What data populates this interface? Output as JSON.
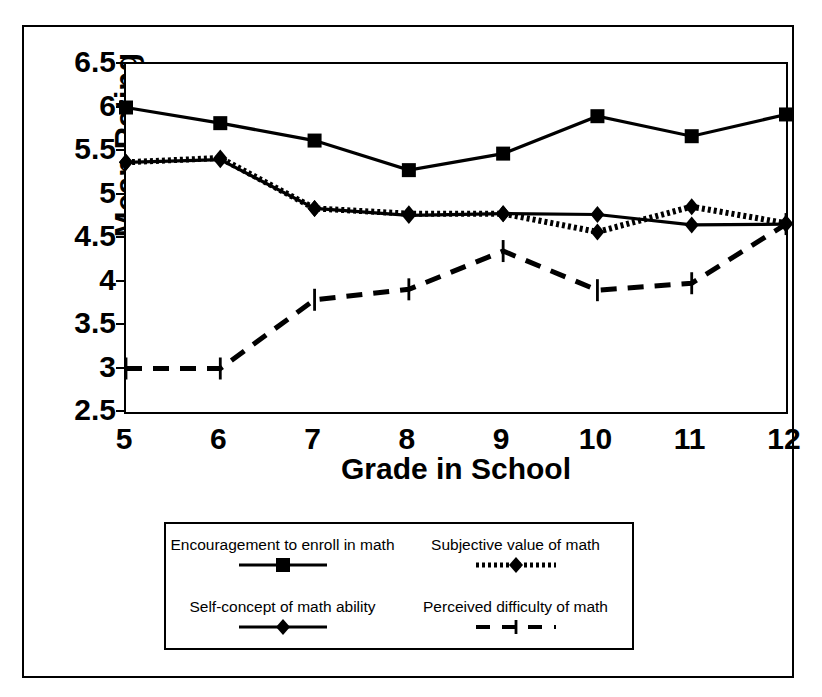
{
  "chart_data": {
    "type": "line",
    "title": "",
    "xlabel": "Grade in School",
    "ylabel": "Mean Rating",
    "categories": [
      5,
      6,
      7,
      8,
      9,
      10,
      11,
      12
    ],
    "x": [
      5,
      6,
      7,
      8,
      9,
      10,
      11,
      12
    ],
    "xlim": [
      5,
      12
    ],
    "ylim": [
      2.5,
      6.5
    ],
    "yticks": [
      "2.5",
      "3",
      "3.5",
      "4",
      "4.5",
      "5",
      "5.5",
      "6",
      "6.5"
    ],
    "ytick_values": [
      2.5,
      3,
      3.5,
      4,
      4.5,
      5,
      5.5,
      6,
      6.5
    ],
    "xticks": [
      "5",
      "6",
      "7",
      "8",
      "9",
      "10",
      "11",
      "12"
    ],
    "grid": false,
    "legend_position": "below-plot",
    "series": [
      {
        "name": "Encouragement to enroll in math",
        "marker": "square",
        "line_style": "solid",
        "color": "#000000",
        "values": [
          6.0,
          5.82,
          5.62,
          5.28,
          5.47,
          5.9,
          5.67,
          5.92
        ]
      },
      {
        "name": "Subjective value of math",
        "marker": "diamond",
        "line_style": "dotted",
        "color": "#000000",
        "values": [
          5.37,
          5.42,
          4.84,
          4.78,
          4.78,
          4.57,
          4.86,
          4.67
        ]
      },
      {
        "name": "Self-concept of math ability",
        "marker": "diamond",
        "line_style": "solid",
        "color": "#000000",
        "values": [
          5.37,
          5.4,
          4.84,
          4.76,
          4.78,
          4.77,
          4.65,
          4.66
        ]
      },
      {
        "name": "Perceived difficulty of math",
        "marker": "dash",
        "line_style": "dashed",
        "color": "#000000",
        "values": [
          3.0,
          3.0,
          3.79,
          3.91,
          4.35,
          3.9,
          3.98,
          4.66
        ]
      }
    ]
  },
  "axis": {
    "ylabel": "Mean Rating",
    "xlabel": "Grade in School"
  },
  "legend": {
    "entries": [
      {
        "label": "Encouragement to enroll in math",
        "marker": "square",
        "line_style": "solid"
      },
      {
        "label": "Subjective value of math",
        "marker": "diamond",
        "line_style": "dotted"
      },
      {
        "label": "Self-concept of math ability",
        "marker": "diamond",
        "line_style": "solid"
      },
      {
        "label": "Perceived difficulty of math",
        "marker": "dash",
        "line_style": "dashed"
      }
    ]
  },
  "caption": {
    "text": ""
  }
}
